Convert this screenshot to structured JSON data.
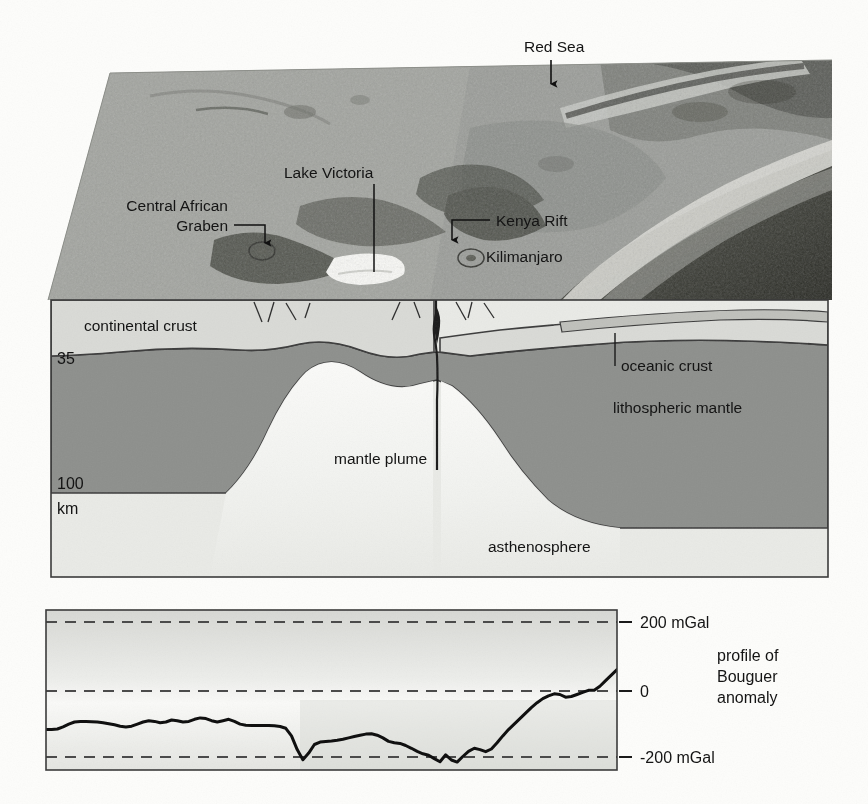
{
  "figure": {
    "title_absent": true,
    "map_labels": [
      {
        "id": "red-sea",
        "text": "Red Sea"
      },
      {
        "id": "lake-victoria",
        "text": "Lake Victoria"
      },
      {
        "id": "central-african-graben",
        "line1": "Central African",
        "line2": "Graben",
        "text": "Central African Graben"
      },
      {
        "id": "kenya-rift",
        "text": "Kenya Rift"
      },
      {
        "id": "kilimanjaro",
        "text": "Kilimanjaro"
      }
    ],
    "cross_section_labels": [
      {
        "id": "continental-crust",
        "text": "continental crust"
      },
      {
        "id": "oceanic-crust",
        "text": "oceanic crust"
      },
      {
        "id": "lithospheric-mantle",
        "text": "lithospheric mantle"
      },
      {
        "id": "mantle-plume",
        "text": "mantle plume"
      },
      {
        "id": "asthenosphere",
        "text": "asthenosphere"
      }
    ],
    "depth_scale": [
      {
        "id": "depth-35",
        "text": "35"
      },
      {
        "id": "depth-100",
        "text": "100"
      },
      {
        "id": "depth-unit",
        "text": "km"
      }
    ],
    "profile_caption": {
      "line1": "profile of",
      "line2": "Bouguer",
      "line3": "anomaly"
    },
    "colors": {
      "page_background": "#fdfdfb",
      "continental_crust": "#d9dad6",
      "lithospheric_mantle": "#8d8f8c",
      "asthenosphere": "#e8e9e6",
      "mantle_plume": "#f2f3f0",
      "outline": "#3b3b3b",
      "map_land": "#9a9c98",
      "map_highland": "#5d5f5c",
      "map_ocean_deep": "#3a3b38",
      "map_lake": "#fbfbf8",
      "curve": "#101010",
      "dashed_guide": "#4b4b4b",
      "chart_background": "#edeeea"
    }
  },
  "chart_data": {
    "type": "line",
    "title": "profile of Bouguer anomaly",
    "xlabel": "",
    "ylabel": "mGal",
    "ylim": [
      -300,
      300
    ],
    "yticks": [
      200,
      0,
      -200
    ],
    "ytick_labels": [
      "200 mGal",
      "0",
      "-200 mGal"
    ],
    "grid": "dashed horizontal gridlines at 200, 0 and -200 mGal",
    "legend_position": "right",
    "series": [
      {
        "name": "Bouguer anomaly",
        "units": "mGal",
        "x": [
          0,
          1,
          2,
          3,
          4,
          5,
          6,
          7,
          8,
          9,
          10,
          11,
          12,
          13,
          14,
          15,
          16,
          17,
          18,
          19,
          20,
          21,
          22,
          23,
          24,
          25,
          26,
          27,
          28,
          29,
          30,
          31,
          32,
          33,
          34,
          35,
          36,
          37,
          38,
          39,
          40,
          41,
          42,
          43,
          44,
          45,
          46,
          47,
          48,
          49,
          50,
          51,
          52,
          53,
          54,
          55,
          56,
          57,
          58,
          59,
          60,
          61,
          62,
          63,
          64,
          65,
          66,
          67,
          68,
          69,
          70,
          71,
          72,
          73,
          74,
          75,
          76,
          77,
          78,
          79,
          80,
          81,
          82,
          83,
          84,
          85,
          86,
          87,
          88,
          89,
          90,
          91,
          92,
          93,
          94,
          95,
          96,
          97,
          98,
          99,
          100
        ],
        "y": [
          -112,
          -112,
          -110,
          -104,
          -96,
          -90,
          -88,
          -88,
          -89,
          -90,
          -92,
          -95,
          -98,
          -102,
          -104,
          -102,
          -96,
          -90,
          -86,
          -88,
          -92,
          -90,
          -84,
          -86,
          -90,
          -88,
          -82,
          -78,
          -80,
          -86,
          -90,
          -86,
          -82,
          -88,
          -96,
          -99,
          -100,
          -100,
          -100,
          -100,
          -101,
          -103,
          -108,
          -130,
          -170,
          -199,
          -180,
          -155,
          -148,
          -146,
          -145,
          -143,
          -140,
          -136,
          -132,
          -128,
          -125,
          -124,
          -128,
          -136,
          -146,
          -150,
          -152,
          -158,
          -166,
          -175,
          -182,
          -186,
          -196,
          -205,
          -185,
          -200,
          -206,
          -190,
          -175,
          -166,
          -170,
          -176,
          -168,
          -150,
          -130,
          -112,
          -96,
          -80,
          -64,
          -48,
          -34,
          -22,
          -14,
          -8,
          -10,
          -18,
          -16,
          -10,
          -4,
          2,
          2,
          14,
          30,
          46,
          62
        ]
      }
    ],
    "annotations": [
      {
        "text": "200 mGal",
        "at_y": 200
      },
      {
        "text": "0",
        "at_y": 0
      },
      {
        "text": "-200 mGal",
        "at_y": -200
      }
    ]
  }
}
